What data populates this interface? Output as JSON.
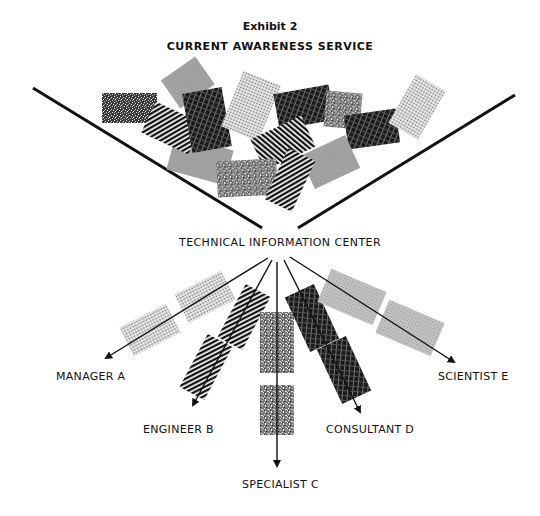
{
  "header": {
    "exhibit": "Exhibit 2",
    "title": "CURRENT AWARENESS SERVICE"
  },
  "center": {
    "label": "TECHNICAL INFORMATION CENTER"
  },
  "recipients": [
    {
      "id": "manager",
      "label": "MANAGER A"
    },
    {
      "id": "engineer",
      "label": "ENGINEER B"
    },
    {
      "id": "specialist",
      "label": "SPECIALIST C"
    },
    {
      "id": "consultant",
      "label": "CONSULTANT D"
    },
    {
      "id": "scientist",
      "label": "SCIENTIST E"
    }
  ],
  "legend_patterns": {
    "manager": "light-dot",
    "engineer": "diagonal-stripe",
    "specialist": "coarse-noise",
    "consultant": "dark-crosshatch",
    "scientist": "light-grid"
  },
  "colors": {
    "ink": "#111111",
    "paper": "#ffffff",
    "gray_light": "#bdbdbd",
    "gray_mid": "#8a8a8a"
  }
}
